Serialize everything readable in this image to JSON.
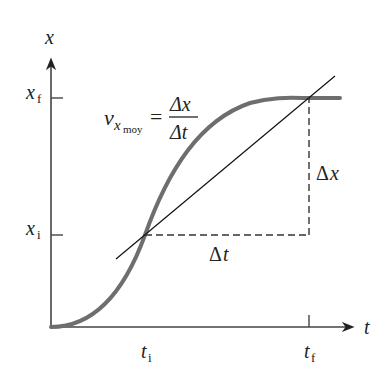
{
  "diagram": {
    "type": "position-time graph with secant line (average velocity)",
    "axes": {
      "vertical_label": "x",
      "horizontal_label": "t"
    },
    "ticks": {
      "x_final": {
        "base": "x",
        "sub": "f"
      },
      "x_initial": {
        "base": "x",
        "sub": "i"
      },
      "t_initial": {
        "base": "t",
        "sub": "i"
      },
      "t_final": {
        "base": "t",
        "sub": "f"
      }
    },
    "equation": {
      "lhs_base": "v",
      "lhs_sub": "x",
      "lhs_subsub": "moy",
      "equals": "=",
      "numerator": "Δx",
      "denominator": "Δt"
    },
    "deltas": {
      "delta_x": {
        "sym": "Δ",
        "var": "x"
      },
      "delta_t": {
        "sym": "Δ",
        "var": "t"
      }
    },
    "colors": {
      "curve": "#6e6e6e",
      "axes": "#444444",
      "secant": "#111111",
      "dashed": "#333333"
    }
  }
}
